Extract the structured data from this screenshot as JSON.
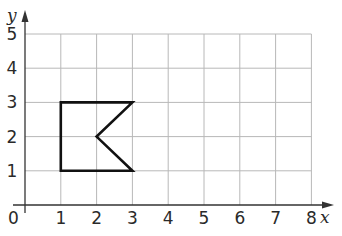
{
  "diagram": {
    "type": "coordinate-grid",
    "x_axis": {
      "label": "x",
      "min": 0,
      "max": 8,
      "ticks": [
        "0",
        "1",
        "2",
        "3",
        "4",
        "5",
        "6",
        "7",
        "8"
      ]
    },
    "y_axis": {
      "label": "y",
      "min": 0,
      "max": 5,
      "ticks": [
        "1",
        "2",
        "3",
        "4",
        "5"
      ]
    },
    "origin_label": "0",
    "shape": {
      "name": "pentagon-arrow-notch",
      "vertices": [
        [
          1,
          1
        ],
        [
          1,
          3
        ],
        [
          3,
          3
        ],
        [
          2,
          2
        ],
        [
          3,
          1
        ]
      ]
    },
    "colors": {
      "grid": "#b8b8b8",
      "axis": "#333333",
      "shape": "#111111"
    }
  }
}
